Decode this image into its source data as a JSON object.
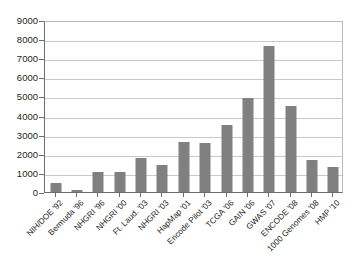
{
  "chart_data": {
    "type": "bar",
    "title": "",
    "xlabel": "",
    "ylabel": "",
    "ylim": [
      0,
      9000
    ],
    "grid": true,
    "legend": "none",
    "bar_color": "#808080",
    "categories": [
      "NIH/DOE '92",
      "Bermuda '96",
      "NHGRI '96",
      "NHGRI '00",
      "Ft. Laud. '03",
      "NHGRI '03",
      "HapMap '01",
      "Encode Pilot '03",
      "TCGA '06",
      "GAIN '06",
      "GWAS '07",
      "ENCODE '08",
      "1000 Genomes '08",
      "HMP '10"
    ],
    "values": [
      450,
      130,
      1060,
      1040,
      1800,
      1410,
      2640,
      2570,
      3530,
      4900,
      7620,
      4520,
      1680,
      1300
    ],
    "yticks": [
      0,
      1000,
      2000,
      3000,
      4000,
      5000,
      6000,
      7000,
      8000,
      9000
    ],
    "ytick_labels": [
      "0",
      "1000",
      "2000",
      "3000",
      "4000",
      "5000",
      "6000",
      "7000",
      "8000",
      "9000"
    ]
  }
}
